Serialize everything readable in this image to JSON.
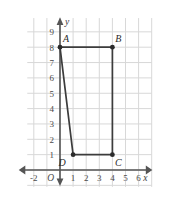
{
  "chart_data": {
    "type": "scatter",
    "title": "",
    "xlabel": "x",
    "ylabel": "y",
    "grid": true,
    "legend": null,
    "xlim": [
      -3,
      7
    ],
    "ylim": [
      -1,
      10
    ],
    "xticks": [
      -2,
      1,
      2,
      3,
      4,
      5,
      6
    ],
    "yticks": [
      1,
      2,
      3,
      4,
      5,
      6,
      7,
      8,
      9
    ],
    "xtick_labels": [
      "-2",
      "1",
      "2",
      "3",
      "4",
      "5",
      "6"
    ],
    "ytick_labels": [
      "1",
      "2",
      "3",
      "4",
      "5",
      "6",
      "7",
      "8",
      "9"
    ],
    "origin_label": "O",
    "shape": "quadrilateral",
    "points": [
      {
        "name": "A",
        "x": 0,
        "y": 8,
        "label_dx": 6,
        "label_dy": -5
      },
      {
        "name": "B",
        "x": 4,
        "y": 8,
        "label_dx": 6,
        "label_dy": -5
      },
      {
        "name": "C",
        "x": 4,
        "y": 1,
        "label_dx": 6,
        "label_dy": 11
      },
      {
        "name": "D",
        "x": 1,
        "y": 1,
        "label_dx": -11,
        "label_dy": 11
      }
    ],
    "edges": [
      {
        "from": "A",
        "to": "B"
      },
      {
        "from": "B",
        "to": "C"
      },
      {
        "from": "C",
        "to": "D"
      },
      {
        "from": "D",
        "to": "A"
      }
    ],
    "colors": {
      "grid": "#d8d8d8",
      "axis": "#555555",
      "shape_stroke": "#3c3c3c",
      "vertex_fill": "#2b2b2b",
      "background": "#ffffff",
      "tick_text": "#4a4a4a"
    }
  }
}
